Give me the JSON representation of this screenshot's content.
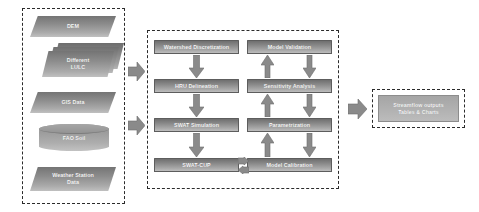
{
  "figure": {
    "background_color": "#ffffff",
    "node_fill_dark": "#6f6f6f",
    "node_fill_light": "#bdbdbd",
    "border_color": "#2b2b2b",
    "text_color": "#ffffff"
  },
  "groups": [
    {
      "id": "inputs",
      "name": "input-data-group"
    },
    {
      "id": "process",
      "name": "modelling-process-group"
    },
    {
      "id": "outputs",
      "name": "outputs-group"
    }
  ],
  "inputs": {
    "items": [
      {
        "label": "DEM",
        "shape": "parallelogram"
      },
      {
        "label": "Different\nLULC",
        "line1": "Different",
        "line2": "LULC",
        "shape": "stacked-parallelogram"
      },
      {
        "label": "GIS Data",
        "shape": "parallelogram"
      },
      {
        "label": "FAO Soil",
        "shape": "cylinder"
      },
      {
        "label": "Weather Station\nData",
        "line1": "Weather Station",
        "line2": "Data",
        "shape": "parallelogram"
      }
    ]
  },
  "process": {
    "left_column": [
      {
        "label": "Watershed Discretization"
      },
      {
        "label": "HRU Delineation"
      },
      {
        "label": "SWAT Simulation"
      },
      {
        "label": "SWAT-CUP"
      }
    ],
    "right_column": [
      {
        "label": "Model Validation"
      },
      {
        "label": "Sensitivity Analysis"
      },
      {
        "label": "Parametrization"
      },
      {
        "label": "Model Calibration"
      }
    ]
  },
  "outputs": {
    "items": [
      {
        "line1": "Streamflow outputs",
        "line2": "Tables & Charts"
      }
    ]
  },
  "connectors": [
    {
      "name": "inputs-to-process-upper",
      "direction": "right"
    },
    {
      "name": "inputs-to-process-lower",
      "direction": "right"
    },
    {
      "name": "watershed-to-hru",
      "direction": "down"
    },
    {
      "name": "hru-to-swat-simulation",
      "direction": "down"
    },
    {
      "name": "swat-simulation-to-swat-cup",
      "direction": "down"
    },
    {
      "name": "swat-cup-to-model-calibration",
      "direction": "bidirectional-horizontal"
    },
    {
      "name": "model-calibration-to-parametrization",
      "direction": "up"
    },
    {
      "name": "parametrization-to-model-calibration",
      "direction": "down"
    },
    {
      "name": "parametrization-to-sensitivity",
      "direction": "up"
    },
    {
      "name": "sensitivity-to-parametrization",
      "direction": "down"
    },
    {
      "name": "sensitivity-to-model-validation",
      "direction": "up"
    },
    {
      "name": "model-validation-to-sensitivity",
      "direction": "down"
    },
    {
      "name": "process-to-outputs",
      "direction": "right"
    }
  ]
}
